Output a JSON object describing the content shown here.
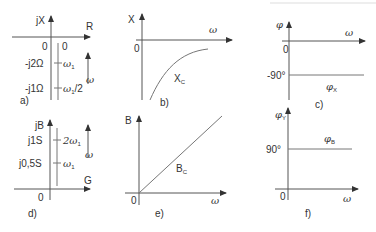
{
  "panels": {
    "a": {
      "label": "a)",
      "y_axis": "jX",
      "x_axis": "R",
      "origin": "0",
      "col_zero": "0",
      "ticks": [
        {
          "value": "-j2Ω",
          "freq": "ω",
          "freq_sub": "1",
          "freq_suffix": ""
        },
        {
          "value": "-j1Ω",
          "freq": "ω",
          "freq_sub": "1",
          "freq_suffix": "/2"
        }
      ],
      "omega_arrow": "ω"
    },
    "b": {
      "label": "b)",
      "y_axis": "X",
      "x_axis": "ω",
      "origin": "0",
      "curve": "X",
      "curve_sub": "C"
    },
    "c": {
      "label": "c)",
      "y_axis": "φ",
      "x_axis": "ω",
      "origin": "0",
      "level": "-90°",
      "curve": "φ",
      "curve_sub": "X"
    },
    "d": {
      "label": "d)",
      "y_axis": "jB",
      "x_axis": "G",
      "origin": "0",
      "ticks": [
        {
          "value": "j1S",
          "freq": "2ω",
          "freq_sub": "1"
        },
        {
          "value": "j0,5S",
          "freq": "ω",
          "freq_sub": "1"
        }
      ],
      "omega_arrow": "ω"
    },
    "e": {
      "label": "e)",
      "y_axis": "B",
      "x_axis": "ω",
      "origin": "0",
      "curve": "B",
      "curve_sub": "C"
    },
    "f": {
      "label": "f)",
      "y_axis": "φ",
      "y_axis_sub": "Y",
      "x_axis": "ω",
      "origin": "0",
      "level": "90°",
      "curve": "φ",
      "curve_sub": "B"
    }
  }
}
